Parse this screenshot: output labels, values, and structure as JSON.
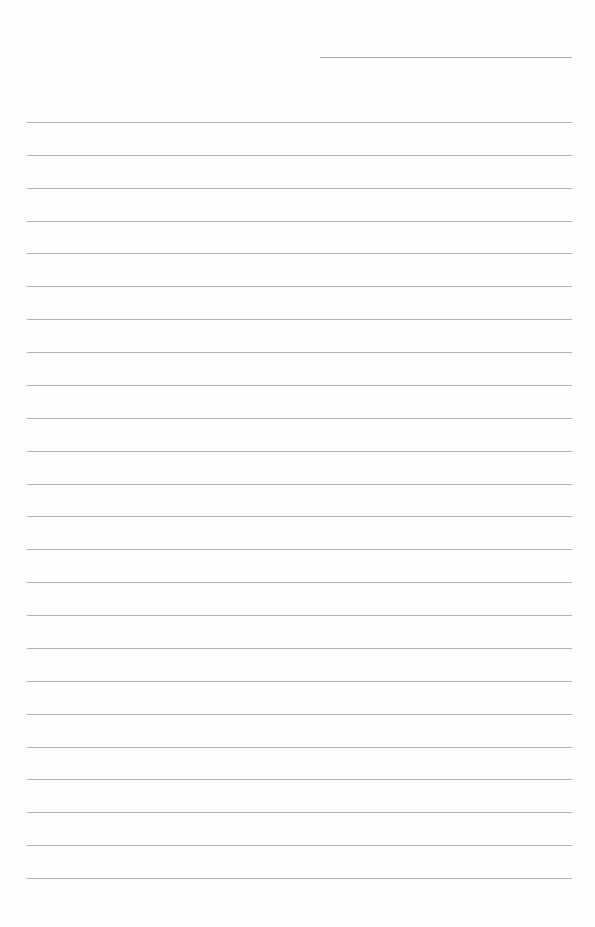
{
  "page": {
    "type": "lined-notepaper",
    "header_field": {
      "label": "",
      "value": ""
    },
    "rules": {
      "count": 24,
      "first_y": 122,
      "spacing": 32.87,
      "left": 27,
      "width": 545,
      "color": "#b4b4b4"
    },
    "header_line_color": "#a8a8a8",
    "background": "#fefefe"
  }
}
